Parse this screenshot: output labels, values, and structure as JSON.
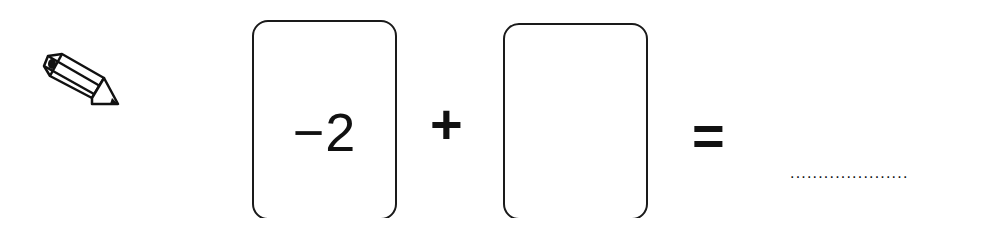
{
  "worksheet": {
    "icon": "pencil-icon",
    "equation": {
      "left_card": {
        "value": "−2"
      },
      "operator": "+",
      "right_card": {
        "value": ""
      },
      "equals": "=",
      "answer": {
        "value": "",
        "placeholder": "....................."
      }
    }
  }
}
